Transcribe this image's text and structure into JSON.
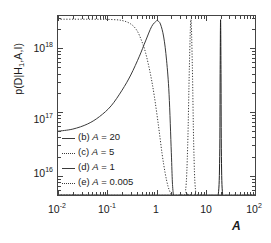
{
  "figure": {
    "background_color": "#ffffff",
    "axis_color": "#444444",
    "curve_color": "#3a3a3a"
  },
  "axes": {
    "ylabel_html": "p(D|H<span class=\"sb\">1</span>,A,I)",
    "ylabel_text": "p(D|H1,A,I)",
    "xlabel": "A",
    "x_scale": "log",
    "y_scale": "log",
    "xlim": [
      0.01,
      100
    ],
    "ylim": [
      5000000000000000.0,
      3.2e+18
    ],
    "grid": false,
    "y_ticks": [
      {
        "value": 1e+18,
        "label_mantissa": "10",
        "label_exponent": "18"
      },
      {
        "value": 1e+17,
        "label_mantissa": "10",
        "label_exponent": "17"
      },
      {
        "value": 1e+16,
        "label_mantissa": "10",
        "label_exponent": "16"
      }
    ],
    "x_ticks": [
      {
        "value": 0.01,
        "label_mantissa": "10",
        "label_exponent": "-2"
      },
      {
        "value": 0.1,
        "label_mantissa": "10",
        "label_exponent": "-1"
      },
      {
        "value": 1,
        "label_mantissa": "1",
        "label_exponent": ""
      },
      {
        "value": 10,
        "label_mantissa": "10",
        "label_exponent": ""
      },
      {
        "value": 100,
        "label_mantissa": "10",
        "label_exponent": "2"
      }
    ]
  },
  "legend": {
    "position": "center-left",
    "items": [
      {
        "key": "b",
        "label_prefix": "(b)",
        "var": "A",
        "eq": "=",
        "value": "20",
        "text": "(b) A = 20",
        "style": "solid"
      },
      {
        "key": "c",
        "label_prefix": "(c)",
        "var": "A",
        "eq": "=",
        "value": "5",
        "text": "(c) A = 5",
        "style": "dotted"
      },
      {
        "key": "d",
        "label_prefix": "(d)",
        "var": "A",
        "eq": "=",
        "value": "1",
        "text": "(d) A = 1",
        "style": "solid"
      },
      {
        "key": "e",
        "label_prefix": "(e)",
        "var": "A",
        "eq": "=",
        "value": "0.005",
        "text": "(e) A = 0.005",
        "style": "dotted"
      }
    ]
  },
  "chart_data": {
    "type": "line",
    "title": "",
    "xlabel": "A",
    "ylabel": "p(D|H1,A,I)",
    "xscale": "log",
    "yscale": "log",
    "xlim": [
      0.01,
      100
    ],
    "ylim": [
      5000000000000000,
      3200000000000000000
    ],
    "grid": false,
    "legend_position": "center-left",
    "series": [
      {
        "name": "(b) A = 20",
        "style": "solid",
        "peak_x": 20,
        "peak_y": 2.8e+18,
        "description": "very narrow spike centred at A = 20",
        "x": [
          0.01,
          15,
          18,
          19.2,
          19.6,
          20,
          20.4,
          20.8,
          22,
          26,
          100
        ],
        "y": [
          5000000000000000.0,
          5000000000000000.0,
          5200000000000000.0,
          2e+16,
          4e+17,
          2.8e+18,
          4e+17,
          2e+16,
          5200000000000000.0,
          5000000000000000.0,
          5000000000000000.0
        ]
      },
      {
        "name": "(c) A = 5",
        "style": "dotted",
        "peak_x": 5,
        "peak_y": 2.8e+18,
        "description": "narrow spike centred at A = 5",
        "x": [
          0.01,
          3.2,
          3.9,
          4.3,
          4.65,
          5.0,
          5.35,
          5.7,
          6.2,
          7.5,
          100
        ],
        "y": [
          5000000000000000.0,
          5000000000000000.0,
          6000000000000000.0,
          3e+16,
          5e+17,
          2.8e+18,
          5e+17,
          3e+16,
          6000000000000000.0,
          5000000000000000.0,
          5000000000000000.0
        ]
      },
      {
        "name": "(d) A = 1",
        "style": "solid",
        "peak_x": 1.05,
        "peak_y": 2.7e+18,
        "description": "broad rise from 5e16 at A=0.01 to a peak near A=1 then steep fall",
        "x": [
          0.01,
          0.02,
          0.04,
          0.07,
          0.12,
          0.2,
          0.3,
          0.45,
          0.6,
          0.8,
          1.0,
          1.05,
          1.2,
          1.4,
          1.6,
          1.8,
          2.0,
          2.1,
          2.2
        ],
        "y": [
          5e+16,
          5.4e+16,
          6.5e+16,
          8.5e+16,
          1.25e+17,
          2.2e+17,
          3.8e+17,
          7.5e+17,
          1.3e+18,
          2.2e+18,
          2.68e+18,
          2.7e+18,
          2.4e+18,
          1.5e+18,
          6.5e+17,
          1.9e+17,
          2.3e+16,
          8000000000000000.0,
          5000000000000000.0
        ]
      },
      {
        "name": "(e) A = 0.005",
        "style": "dotted",
        "peak_x": 0.01,
        "peak_y": 2.85e+18,
        "description": "flat plateau near 2.85e18 out to A~0.3 then monotonic decline",
        "x": [
          0.01,
          0.03,
          0.07,
          0.12,
          0.2,
          0.3,
          0.4,
          0.5,
          0.6,
          0.75,
          0.9,
          1.1,
          1.3,
          1.5,
          1.7,
          1.9,
          2.05,
          2.15
        ],
        "y": [
          2.85e+18,
          2.85e+18,
          2.84e+18,
          2.82e+18,
          2.72e+18,
          2.4e+18,
          1.9e+18,
          1.3e+18,
          8.5e+17,
          4e+17,
          1.8e+17,
          6e+16,
          2.2e+16,
          1.1e+16,
          7000000000000000.0,
          5500000000000000.0,
          5100000000000000.0,
          5000000000000000.0
        ]
      }
    ]
  }
}
